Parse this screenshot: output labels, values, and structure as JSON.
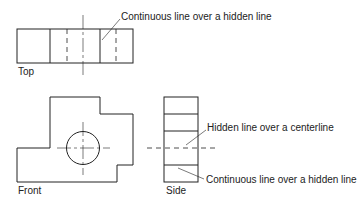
{
  "diagram": {
    "type": "orthographic-projection",
    "views": {
      "top": {
        "label": "Top"
      },
      "front": {
        "label": "Front"
      },
      "side": {
        "label": "Side"
      }
    },
    "annotations": [
      {
        "id": "top-callout",
        "text": "Continuous line over a hidden line"
      },
      {
        "id": "side-callout-center",
        "text": "Hidden line over a centerline"
      },
      {
        "id": "side-callout-hidden",
        "text": "Continuous line over a hidden line"
      }
    ],
    "colors": {
      "line": "#222222",
      "background": "#ffffff"
    }
  }
}
